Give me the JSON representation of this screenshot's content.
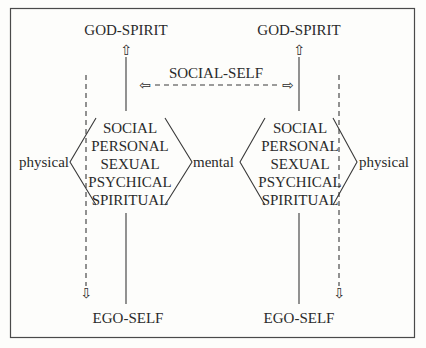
{
  "diagram": {
    "left_model": {
      "top_label": "GOD-SPIRIT",
      "bottom_label": "EGO-SELF",
      "layers": [
        "SOCIAL",
        "PERSONAL",
        "SEXUAL",
        "PSYCHICAL",
        "SPIRITUAL"
      ],
      "left_side_label": "physical",
      "right_side_label": "mental"
    },
    "right_model": {
      "top_label": "GOD-SPIRIT",
      "bottom_label": "EGO-SELF",
      "layers": [
        "SOCIAL",
        "PERSONAL",
        "SEXUAL",
        "PSYCHICAL",
        "SPIRITUAL"
      ],
      "right_side_label": "physical"
    },
    "connector": {
      "label": "SOCIAL-SELF",
      "style": "dashed",
      "direction": "bidirectional"
    },
    "arrows": {
      "up": "⇧",
      "down": "⇩",
      "left": "⇦",
      "right": "⇨"
    }
  }
}
